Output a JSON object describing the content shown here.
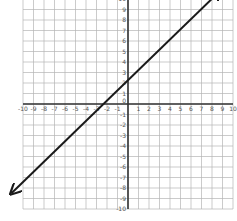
{
  "chart_data": {
    "type": "line",
    "title": "",
    "xlabel": "",
    "ylabel": "",
    "xlim": [
      -10,
      10
    ],
    "ylim": [
      -10,
      10
    ],
    "grid": true,
    "x_ticks": [
      -10,
      -9,
      -8,
      -7,
      -6,
      -5,
      -4,
      -3,
      -2,
      -1,
      0,
      1,
      2,
      3,
      4,
      5,
      6,
      7,
      8,
      9,
      10
    ],
    "y_ticks": [
      -10,
      -9,
      -8,
      -7,
      -6,
      -5,
      -4,
      -3,
      -2,
      -1,
      0,
      1,
      2,
      3,
      4,
      5,
      6,
      7,
      8,
      9,
      10
    ],
    "series": [
      {
        "name": "y = x + 2",
        "equation": "y = x + 2",
        "slope": 1,
        "intercept": 2,
        "x": [
          -11.1,
          8.8
        ],
        "y": [
          -8.5,
          10.8
        ],
        "arrows": "both",
        "color": "#1a1a1a"
      }
    ],
    "key_points": [
      {
        "label": "y-intercept",
        "x": 0,
        "y": 2
      },
      {
        "label": "x-intercept",
        "x": -2,
        "y": 0
      }
    ]
  },
  "colors": {
    "grid": "#b5b5b5",
    "axis": "#333333",
    "line": "#1a1a1a",
    "background": "#ffffff"
  }
}
